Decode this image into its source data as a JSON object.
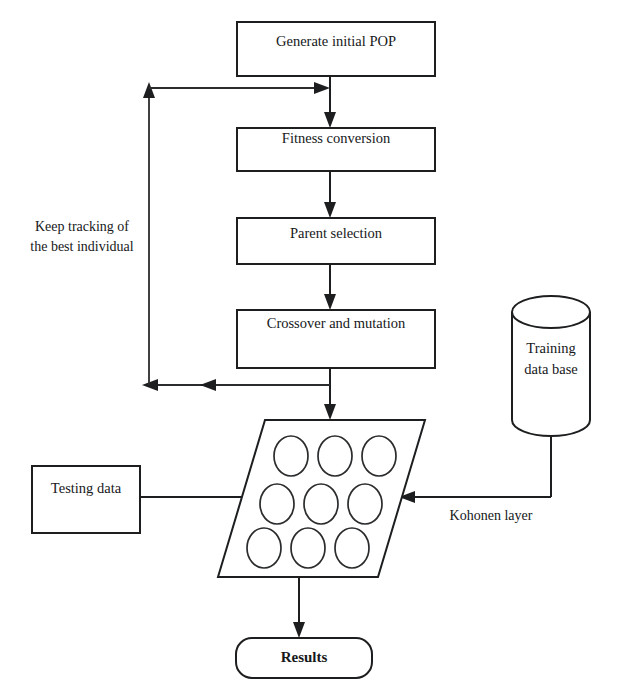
{
  "diagram": {
    "type": "flowchart",
    "background_color": "#ffffff",
    "stroke_color": "#1c1e20",
    "nodes": {
      "generate_pop": {
        "label": "Generate initial POP",
        "shape": "rectangle"
      },
      "fitness": {
        "label": "Fitness conversion",
        "shape": "rectangle"
      },
      "parent_selection": {
        "label": "Parent selection",
        "shape": "rectangle"
      },
      "crossover": {
        "label": "Crossover and mutation",
        "shape": "rectangle"
      },
      "kohonen_grid": {
        "label": "",
        "shape": "parallelogram",
        "rows": 3,
        "columns": 3,
        "cell_count": 9
      },
      "testing_data": {
        "label": "Testing data",
        "shape": "rectangle"
      },
      "training_db": {
        "label_line1": "Training",
        "label_line2": "data base",
        "shape": "cylinder"
      },
      "results": {
        "label": "Results",
        "shape": "rounded-rectangle"
      }
    },
    "annotations": {
      "feedback_loop_line1": "Keep tracking of",
      "feedback_loop_line2": "the best individual",
      "kohonen_layer": "Kohonen layer"
    },
    "edges": [
      {
        "from": "generate_pop",
        "to": "fitness",
        "direction": "down"
      },
      {
        "from": "fitness",
        "to": "parent_selection",
        "direction": "down"
      },
      {
        "from": "parent_selection",
        "to": "crossover",
        "direction": "down"
      },
      {
        "from": "crossover",
        "to": "kohonen_grid",
        "direction": "down"
      },
      {
        "from": "crossover",
        "to": "feedback_loop",
        "direction": "left"
      },
      {
        "from": "feedback_loop",
        "to": "fitness",
        "direction": "right"
      },
      {
        "from": "testing_data",
        "to": "kohonen_grid",
        "direction": "right"
      },
      {
        "from": "training_db",
        "to": "kohonen_grid",
        "direction": "left"
      },
      {
        "from": "kohonen_grid",
        "to": "results",
        "direction": "down"
      }
    ]
  }
}
